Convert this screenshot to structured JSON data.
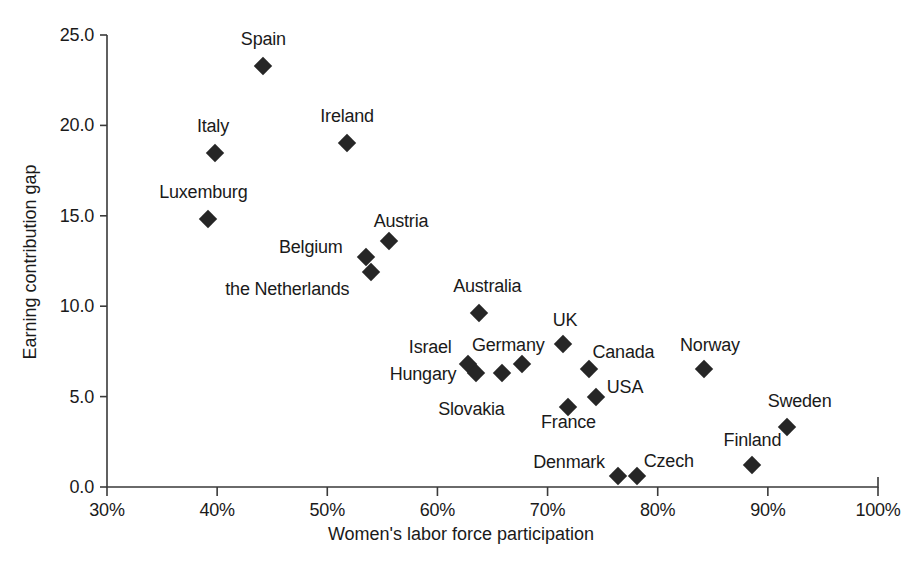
{
  "chart_data": {
    "type": "scatter",
    "title": "",
    "xlabel": "Women's labor force participation",
    "ylabel": "Earning contribution gap",
    "xlim": [
      30,
      100
    ],
    "ylim": [
      0.0,
      25.0
    ],
    "xticks": [
      "30%",
      "40%",
      "50%",
      "60%",
      "70%",
      "80%",
      "90%",
      "100%"
    ],
    "xtick_values": [
      30,
      40,
      50,
      60,
      70,
      80,
      90,
      100
    ],
    "yticks": [
      "0.0",
      "5.0",
      "10.0",
      "15.0",
      "20.0",
      "25.0"
    ],
    "ytick_values": [
      0,
      5,
      10,
      15,
      20,
      25
    ],
    "grid": false,
    "legend": "none",
    "marker": "filled-diamond",
    "marker_color": "#262626",
    "points": [
      {
        "label": "Spain",
        "x": 44.2,
        "y": 23.3,
        "label_dx": 0,
        "label_dy": -27
      },
      {
        "label": "Ireland",
        "x": 51.8,
        "y": 19.0,
        "label_dx": 0,
        "label_dy": -27
      },
      {
        "label": "Italy",
        "x": 39.8,
        "y": 18.5,
        "label_dx": -2,
        "label_dy": -27
      },
      {
        "label": "Luxemburg",
        "x": 39.2,
        "y": 14.8,
        "label_dx": -5,
        "label_dy": -27
      },
      {
        "label": "Austria",
        "x": 55.6,
        "y": 13.6,
        "label_dx": 12,
        "label_dy": -20
      },
      {
        "label": "Belgium",
        "x": 53.5,
        "y": 12.7,
        "label_dx": -55,
        "label_dy": -10
      },
      {
        "label": "the Netherlands",
        "x": 54.0,
        "y": 11.9,
        "label_dx": -84,
        "label_dy": 17
      },
      {
        "label": "Australia",
        "x": 63.8,
        "y": 9.6,
        "label_dx": 8,
        "label_dy": -27
      },
      {
        "label": "UK",
        "x": 71.4,
        "y": 7.9,
        "label_dx": 2,
        "label_dy": -24
      },
      {
        "label": "Germany",
        "x": 67.7,
        "y": 6.8,
        "label_dx": -14,
        "label_dy": -19
      },
      {
        "label": "Israel",
        "x": 62.8,
        "y": 6.8,
        "label_dx": -38,
        "label_dy": -17
      },
      {
        "label": "Canada",
        "x": 73.8,
        "y": 6.5,
        "label_dx": 34,
        "label_dy": -17
      },
      {
        "label": "Norway",
        "x": 84.2,
        "y": 6.5,
        "label_dx": 6,
        "label_dy": -24
      },
      {
        "label": "Hungary",
        "x": 63.5,
        "y": 6.3,
        "label_dx": -53,
        "label_dy": 1
      },
      {
        "label": "Slovakia",
        "x": 65.9,
        "y": 6.3,
        "label_dx": -31,
        "label_dy": 36
      },
      {
        "label": "USA",
        "x": 74.4,
        "y": 5.0,
        "label_dx": 29,
        "label_dy": -10
      },
      {
        "label": "France",
        "x": 71.9,
        "y": 4.4,
        "label_dx": 0,
        "label_dy": 15
      },
      {
        "label": "Sweden",
        "x": 91.7,
        "y": 3.3,
        "label_dx": 13,
        "label_dy": -26
      },
      {
        "label": "Finland",
        "x": 88.6,
        "y": 1.2,
        "label_dx": 0,
        "label_dy": -25
      },
      {
        "label": "Denmark",
        "x": 76.4,
        "y": 0.6,
        "label_dx": -49,
        "label_dy": -14
      },
      {
        "label": "Czech",
        "x": 78.1,
        "y": 0.6,
        "label_dx": 32,
        "label_dy": -15
      }
    ]
  },
  "axis": {
    "x_title": "Women's labor force participation",
    "y_title": "Earning contribution gap"
  }
}
